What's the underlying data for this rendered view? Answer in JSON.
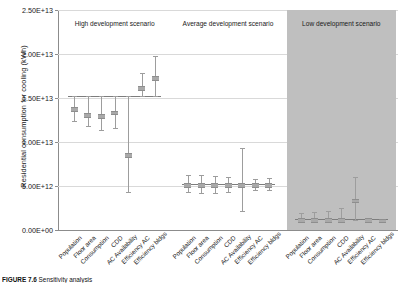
{
  "figure": {
    "ylabel": "Residential consumption for cooling (kWh)",
    "caption_label": "FIGURE 7.6",
    "caption_text": "Sensitivity analysis"
  },
  "yaxis": {
    "ticks": [
      "0.00E+00",
      "5.00E+12",
      "1.00E+13",
      "1.50E+13",
      "2.00E+13",
      "2.50E+13"
    ],
    "tick_values": [
      0,
      5000000000000.0,
      10000000000000.0,
      15000000000000.0,
      20000000000000.0,
      25000000000000.0
    ],
    "min": 0,
    "max": 25000000000000.0
  },
  "scenarios": [
    {
      "title": "High development scenario",
      "shaded": false,
      "baseline": 15200000000000.0
    },
    {
      "title": "Average development scenario",
      "shaded": false,
      "baseline": 5200000000000.0
    },
    {
      "title": "Low development scenario",
      "shaded": true,
      "baseline": 1200000000000.0
    }
  ],
  "chart_data": {
    "type": "bar",
    "title": "",
    "xlabel": "",
    "ylabel": "Residential consumption for cooling (kWh)",
    "ylim": [
      0,
      25000000000000.0
    ],
    "grid": true,
    "legend": "none",
    "note": "Tornado-style sensitivity analysis: for each parameter a vertical range bar shows low/high outcome relative to the scenario baseline.",
    "categories": [
      "Population",
      "Floor area",
      "Consumption",
      "CDD",
      "AC Availability",
      "Efficiency AC",
      "Efficiency bldgs"
    ],
    "groups": [
      {
        "name": "High development scenario",
        "baseline": 15200000000000.0,
        "values": [
          {
            "parameter": "Population",
            "low": 12400000000000.0,
            "high": 15200000000000.0,
            "mid": 13800000000000.0
          },
          {
            "parameter": "Floor area",
            "low": 11800000000000.0,
            "high": 15200000000000.0,
            "mid": 13100000000000.0
          },
          {
            "parameter": "Consumption",
            "low": 11400000000000.0,
            "high": 15200000000000.0,
            "mid": 13000000000000.0
          },
          {
            "parameter": "CDD",
            "low": 11600000000000.0,
            "high": 15200000000000.0,
            "mid": 13400000000000.0
          },
          {
            "parameter": "AC Availability",
            "low": 4300000000000.0,
            "high": 15200000000000.0,
            "mid": 8600000000000.0
          },
          {
            "parameter": "Efficiency AC",
            "low": 15200000000000.0,
            "high": 17800000000000.0,
            "mid": 16200000000000.0
          },
          {
            "parameter": "Efficiency bldgs",
            "low": 15200000000000.0,
            "high": 19800000000000.0,
            "mid": 17300000000000.0
          }
        ]
      },
      {
        "name": "Average development scenario",
        "baseline": 5200000000000.0,
        "values": [
          {
            "parameter": "Population",
            "low": 4300000000000.0,
            "high": 6300000000000.0,
            "mid": 5200000000000.0
          },
          {
            "parameter": "Floor area",
            "low": 4200000000000.0,
            "high": 6250000000000.0,
            "mid": 5200000000000.0
          },
          {
            "parameter": "Consumption",
            "low": 4250000000000.0,
            "high": 6100000000000.0,
            "mid": 5200000000000.0
          },
          {
            "parameter": "CDD",
            "low": 4300000000000.0,
            "high": 6050000000000.0,
            "mid": 5200000000000.0
          },
          {
            "parameter": "AC Availability",
            "low": 2200000000000.0,
            "high": 9300000000000.0,
            "mid": 5200000000000.0
          },
          {
            "parameter": "Efficiency AC",
            "low": 4600000000000.0,
            "high": 5850000000000.0,
            "mid": 5200000000000.0
          },
          {
            "parameter": "Efficiency bldgs",
            "low": 4600000000000.0,
            "high": 5950000000000.0,
            "mid": 5200000000000.0
          }
        ]
      },
      {
        "name": "Low development scenario",
        "baseline": 1200000000000.0,
        "values": [
          {
            "parameter": "Population",
            "low": 1100000000000.0,
            "high": 1950000000000.0,
            "mid": 1200000000000.0
          },
          {
            "parameter": "Floor area",
            "low": 1100000000000.0,
            "high": 2100000000000.0,
            "mid": 1200000000000.0
          },
          {
            "parameter": "Consumption",
            "low": 1100000000000.0,
            "high": 2200000000000.0,
            "mid": 1200000000000.0
          },
          {
            "parameter": "CDD",
            "low": 1100000000000.0,
            "high": 2450000000000.0,
            "mid": 1200000000000.0
          },
          {
            "parameter": "AC Availability",
            "low": 1100000000000.0,
            "high": 6050000000000.0,
            "mid": 3400000000000.0
          },
          {
            "parameter": "Efficiency AC",
            "low": 1050000000000.0,
            "high": 1300000000000.0,
            "mid": 1180000000000.0
          },
          {
            "parameter": "Efficiency bldgs",
            "low": 1000000000000.0,
            "high": 1250000000000.0,
            "mid": 1150000000000.0
          }
        ]
      }
    ]
  }
}
